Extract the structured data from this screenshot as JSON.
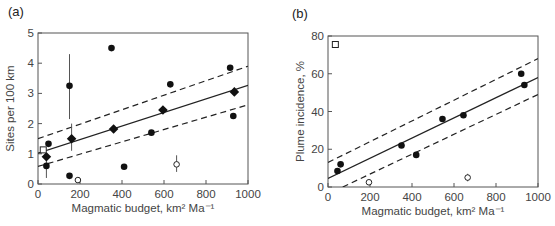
{
  "chart_data": [
    {
      "panel_label": "(a)",
      "type": "scatter",
      "xlabel": "Magmatic budget, km² Ma⁻¹",
      "ylabel": "Sites per 100 km",
      "xlim": [
        0,
        1000
      ],
      "ylim": [
        0,
        5
      ],
      "xticks": [
        0,
        200,
        400,
        600,
        800,
        1000
      ],
      "yticks": [
        0,
        1,
        2,
        3,
        4,
        5
      ],
      "grid": false,
      "series": [
        {
          "name": "filled circles",
          "marker": "circle-filled",
          "points": [
            {
              "x": 350,
              "y": 4.5
            },
            {
              "x": 150,
              "y": 3.25,
              "err_low": 2.15,
              "err_high": 4.3
            },
            {
              "x": 630,
              "y": 3.3
            },
            {
              "x": 915,
              "y": 3.85
            },
            {
              "x": 930,
              "y": 2.25
            },
            {
              "x": 540,
              "y": 1.7
            },
            {
              "x": 410,
              "y": 0.57
            },
            {
              "x": 150,
              "y": 0.27
            },
            {
              "x": 50,
              "y": 1.33
            },
            {
              "x": 40,
              "y": 0.6,
              "err_low": 0.2,
              "err_high": 0.9
            }
          ]
        },
        {
          "name": "diamonds",
          "marker": "diamond-filled",
          "points": [
            {
              "x": 40,
              "y": 0.9
            },
            {
              "x": 160,
              "y": 1.5,
              "err_low": 1.1,
              "err_high": 2.0
            },
            {
              "x": 360,
              "y": 1.82
            },
            {
              "x": 595,
              "y": 2.45
            },
            {
              "x": 935,
              "y": 3.05
            }
          ]
        },
        {
          "name": "open square",
          "marker": "square-open",
          "points": [
            {
              "x": 25,
              "y": 1.13
            }
          ]
        },
        {
          "name": "open circles",
          "marker": "circle-open",
          "points": [
            {
              "x": 190,
              "y": 0.13
            },
            {
              "x": 660,
              "y": 0.65,
              "err_low": 0.4,
              "err_high": 0.95
            }
          ]
        }
      ],
      "lines": [
        {
          "name": "regression",
          "style": "solid",
          "x": [
            0,
            1000
          ],
          "y": [
            1.02,
            3.27
          ]
        },
        {
          "name": "upper confidence",
          "style": "dashed",
          "x": [
            0,
            1000
          ],
          "y": [
            1.5,
            3.9
          ]
        },
        {
          "name": "lower confidence",
          "style": "dashed",
          "x": [
            0,
            1000
          ],
          "y": [
            0.58,
            2.62
          ]
        }
      ]
    },
    {
      "panel_label": "(b)",
      "type": "scatter",
      "xlabel": "Magmatic budget, km² Ma⁻¹",
      "ylabel": "Plume incidence, %",
      "xlim": [
        0,
        1000
      ],
      "ylim": [
        0,
        80
      ],
      "xticks": [
        0,
        200,
        400,
        600,
        800,
        1000
      ],
      "yticks": [
        0,
        20,
        40,
        60,
        80
      ],
      "grid": false,
      "series": [
        {
          "name": "filled circles",
          "marker": "circle-filled",
          "points": [
            {
              "x": 45,
              "y": 8.5
            },
            {
              "x": 60,
              "y": 12
            },
            {
              "x": 350,
              "y": 22
            },
            {
              "x": 420,
              "y": 17
            },
            {
              "x": 545,
              "y": 36
            },
            {
              "x": 645,
              "y": 38
            },
            {
              "x": 920,
              "y": 60
            },
            {
              "x": 935,
              "y": 54
            }
          ]
        },
        {
          "name": "open square",
          "marker": "square-open",
          "points": [
            {
              "x": 35,
              "y": 75.5
            }
          ]
        },
        {
          "name": "open circles",
          "marker": "circle-open",
          "points": [
            {
              "x": 195,
              "y": 2.5
            },
            {
              "x": 665,
              "y": 5,
              "err_low": 3,
              "err_high": 7
            }
          ]
        }
      ],
      "lines": [
        {
          "name": "regression",
          "style": "solid",
          "x": [
            0,
            1000
          ],
          "y": [
            4.5,
            58
          ]
        },
        {
          "name": "upper confidence",
          "style": "dashed",
          "x": [
            0,
            1000
          ],
          "y": [
            13,
            68
          ]
        },
        {
          "name": "lower confidence",
          "style": "dashed",
          "x": [
            70,
            1000
          ],
          "y": [
            0,
            49
          ]
        }
      ]
    }
  ],
  "layout": [
    {
      "x0": 38,
      "x1": 248,
      "y0": 184,
      "y1": 33,
      "label_x": 8,
      "label_y": 16
    },
    {
      "x0": 328,
      "x1": 538,
      "y0": 187,
      "y1": 36,
      "label_x": 292,
      "label_y": 18
    }
  ]
}
